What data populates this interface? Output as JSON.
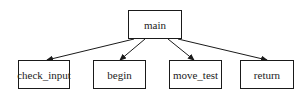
{
  "diagram": {
    "type": "call-tree",
    "root": {
      "id": "main",
      "label": "main"
    },
    "children": [
      {
        "id": "check_input",
        "label": "check_input"
      },
      {
        "id": "begin",
        "label": "begin"
      },
      {
        "id": "move_test",
        "label": "move_test"
      },
      {
        "id": "return",
        "label": "return"
      }
    ],
    "edges": [
      {
        "from": "main",
        "to": "check_input"
      },
      {
        "from": "main",
        "to": "begin"
      },
      {
        "from": "main",
        "to": "move_test"
      },
      {
        "from": "main",
        "to": "return"
      }
    ],
    "colors": {
      "stroke": "#1a1a1a",
      "background": "#ffffff",
      "text": "#222222"
    }
  }
}
